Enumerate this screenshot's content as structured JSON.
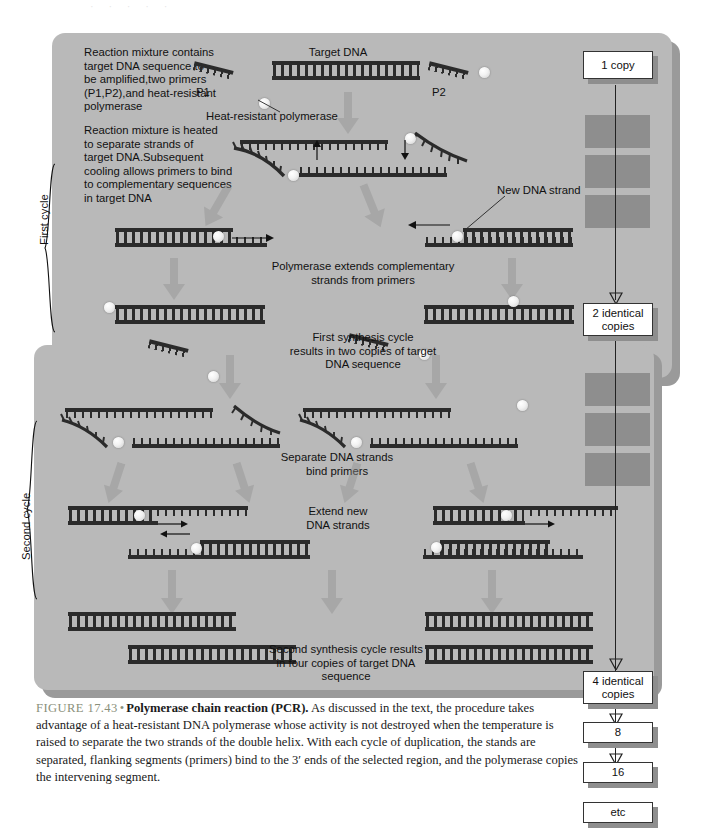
{
  "top_artifact": "· · · · ·",
  "figure": {
    "steps": [
      {
        "id": "step-mixture",
        "text": "Reaction mixture contains\ntarget DNA sequence to\nbe amplified,two primers\n(P1,P2),and heat-resistant\npolymerase"
      },
      {
        "id": "step-heated",
        "text": "Reaction mixture is heated\nto separate strands of\ntarget DNA.Subsequent\ncooling allows primers to bind\nto complementary sequences\nin target DNA"
      },
      {
        "id": "step-extend",
        "text": "Polymerase extends complementary\nstrands from primers"
      },
      {
        "id": "step-first-result",
        "text": "First synthesis cycle\nresults in two copies of target\nDNA sequence"
      },
      {
        "id": "step-separate",
        "text": "Separate DNA strands\nbind primers"
      },
      {
        "id": "step-extend-new",
        "text": "Extend new\nDNA strands"
      },
      {
        "id": "step-second-result",
        "text": "Second synthesis cycle results\nin four copies of target DNA\nsequence"
      }
    ],
    "labels": {
      "target_dna": "Target DNA",
      "primer1": "P1",
      "primer2": "P2",
      "polymerase": "Heat-resistant polymerase",
      "new_strand": "New DNA strand",
      "first_cycle": "First cycle",
      "second_cycle": "Second cycle"
    },
    "copy_ladder": [
      {
        "label": "1 copy"
      },
      {
        "label": "2 identical\ncopies"
      },
      {
        "label": "4 identical\ncopies"
      },
      {
        "label": "8"
      },
      {
        "label": "16"
      },
      {
        "label": "etc"
      }
    ]
  },
  "caption": {
    "figure_number": "FIGURE 17.43",
    "bullet": "•",
    "title": "Polymerase chain reaction (PCR).",
    "body": " As discussed in the text, the procedure takes advantage of a heat-resistant DNA polymerase whose activity is not destroyed when the temperature is raised to separate the two strands of the double helix. With each cycle of duplication, the stands are separated, flanking segments (primers) bind to the 3′ ends of the selected region, and the polymerase copies the intervening segment."
  },
  "colors": {
    "panel": "#b9b9b9",
    "panel_shadow": "#9a9a9a",
    "dna": "#2b2b2b",
    "box_border": "#333333",
    "caption_accent": "#8a8f7a"
  }
}
